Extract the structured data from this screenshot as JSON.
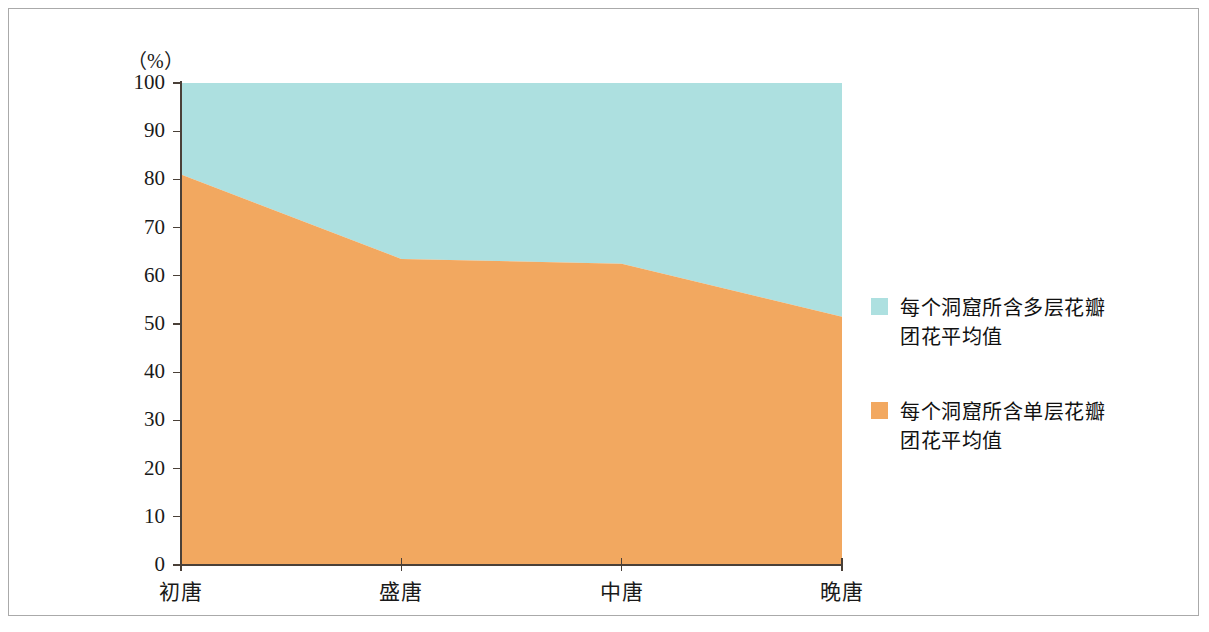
{
  "chart_data": {
    "type": "area",
    "stacked": true,
    "title": "",
    "subtitle": "",
    "xlabel": "",
    "ylabel": "",
    "unit_label": "（%）",
    "categories": [
      "初唐",
      "盛唐",
      "中唐",
      "晚唐"
    ],
    "series": [
      {
        "name": "每个洞窟所含单层花瓣\n团花平均值",
        "color": "#f2a860",
        "values": [
          81,
          63.5,
          62.5,
          51.5
        ],
        "stack_order": 1
      },
      {
        "name": "每个洞窟所含多层花瓣\n团花平均值",
        "color": "#ade0e0",
        "values": [
          19,
          36.5,
          37.5,
          48.5
        ],
        "stack_order": 2
      }
    ],
    "ylim": [
      0,
      100
    ],
    "ytick_values": [
      0,
      10,
      20,
      30,
      40,
      50,
      60,
      70,
      80,
      90,
      100
    ],
    "ytick_labels": [
      "0",
      "10",
      "20",
      "30",
      "40",
      "50",
      "60",
      "70",
      "80",
      "90",
      "100"
    ],
    "grid": false,
    "legend_position": "right"
  },
  "legend": {
    "items": [
      {
        "label": "每个洞窟所含多层花瓣\n团花平均值",
        "color": "#ade0e0"
      },
      {
        "label": "每个洞窟所含单层花瓣\n团花平均值",
        "color": "#f2a860"
      }
    ]
  },
  "colors": {
    "upper_area": "#ade0e0",
    "lower_area": "#f2a860",
    "axis": "#4a4038",
    "frame": "#aaaaaa",
    "text": "#1a1a1a"
  }
}
